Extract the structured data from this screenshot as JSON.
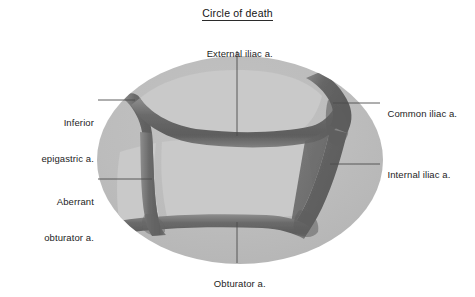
{
  "figure": {
    "title": "Circle of death",
    "title_underlined": true,
    "background_color": "#ffffff",
    "ellipse_color": "#bcbcbc",
    "inner_field_color": "#c8c8c8",
    "vessel_color": "#6e6e6e",
    "vessel_shade_dark": "#5a5a5a",
    "vessel_shade_light": "#8c8c8c",
    "leader_line_color": "#4d4d4d",
    "text_color": "#1d1d1d"
  },
  "labels": {
    "external_iliac": "External iliac a.",
    "common_iliac": "Common iliac a.",
    "internal_iliac": "Internal iliac a.",
    "inferior_epigastric_line1": "Inferior",
    "inferior_epigastric_line2": "epigastric a.",
    "aberrant_obturator_line1": "Aberrant",
    "aberrant_obturator_line2": "obturator a.",
    "obturator": "Obturator a."
  },
  "structures": [
    {
      "name": "external-iliac-artery",
      "label": "External iliac a.",
      "position": "top-center",
      "leader": "vertical-down"
    },
    {
      "name": "common-iliac-artery",
      "label": "Common iliac a.",
      "position": "right-upper",
      "leader": "horizontal-left"
    },
    {
      "name": "internal-iliac-artery",
      "label": "Internal iliac a.",
      "position": "right-lower",
      "leader": "horizontal-left"
    },
    {
      "name": "inferior-epigastric-artery",
      "label": "Inferior epigastric a.",
      "position": "left-upper",
      "leader": "horizontal-right"
    },
    {
      "name": "aberrant-obturator-artery",
      "label": "Aberrant obturator a.",
      "position": "left-lower",
      "leader": "horizontal-right"
    },
    {
      "name": "obturator-artery",
      "label": "Obturator a.",
      "position": "bottom-center",
      "leader": "vertical-up"
    }
  ]
}
